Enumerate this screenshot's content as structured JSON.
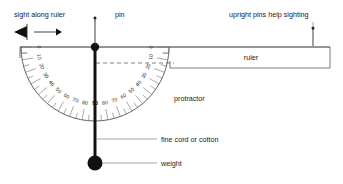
{
  "diagram": {
    "labels": {
      "sight_along_ruler": "sight along ruler",
      "pin": "pin",
      "upright_pins": "upright pins help sighting",
      "ruler": "ruler",
      "protractor": "protractor",
      "fine_cord": "fine cord or cotton",
      "weight": "weight"
    },
    "icons": {
      "eye": "eye-icon",
      "sight_arrow": "arrow-right-icon"
    },
    "colors": {
      "ink": "#2b2b2b",
      "line": "#555b5e",
      "scale": "#6a7072",
      "cord": "#121212",
      "background": "#ffffff"
    },
    "protractor": {
      "center_x": 95,
      "center_y": 47,
      "radius": 74,
      "inner_radius": 66,
      "scale_left": [
        "0",
        "10",
        "20",
        "30",
        "40",
        "50",
        "60",
        "70",
        "80",
        "90"
      ],
      "scale_right": [
        "0",
        "10",
        "20",
        "30",
        "40",
        "50",
        "60",
        "70",
        "80",
        "90"
      ],
      "major_step_degrees": 10,
      "minor_step_degrees": 5
    },
    "ruler": {
      "left_x": 20,
      "right_x": 330,
      "top_y": 47,
      "bottom_y": 68
    },
    "plumb": {
      "pivot_x": 95,
      "pivot_y": 47,
      "weight_y": 163,
      "weight_radius": 7.5,
      "pivot_radius": 4.2
    },
    "pins": [
      {
        "name": "center-pin",
        "x": 95,
        "top_y": 18
      },
      {
        "name": "right-pin",
        "x": 313,
        "top_y": 28
      }
    ]
  }
}
